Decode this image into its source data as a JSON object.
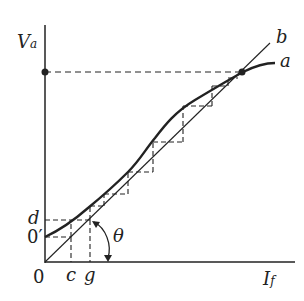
{
  "diagram": {
    "axes": {
      "y_label": "V",
      "y_label_sub": "a",
      "x_label": "I",
      "x_label_sub": "f",
      "origin_label": "0"
    },
    "curves": {
      "magnetization_label": "a",
      "field_resistance_line_label": "b"
    },
    "points": {
      "residual_label": "0′",
      "d_label": "d",
      "c_label": "c",
      "g_label": "g",
      "angle_label": "θ"
    },
    "colors": {
      "ink": "#222222",
      "background": "#ffffff"
    }
  }
}
